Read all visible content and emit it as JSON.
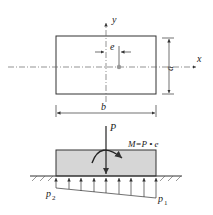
{
  "top_view": {
    "x_axis_label": "x",
    "y_axis_label": "y",
    "eccentricity_label": "e",
    "height_label": "a",
    "width_label": "b"
  },
  "side_view": {
    "force_label": "P",
    "moment_label": "M=P • e",
    "pressure_left_label": "p",
    "pressure_left_sub": "2",
    "pressure_right_label": "p",
    "pressure_right_sub": "1"
  },
  "colors": {
    "line": "#333333",
    "block_fill": "#d6d6d6",
    "centerline": "#666666"
  }
}
